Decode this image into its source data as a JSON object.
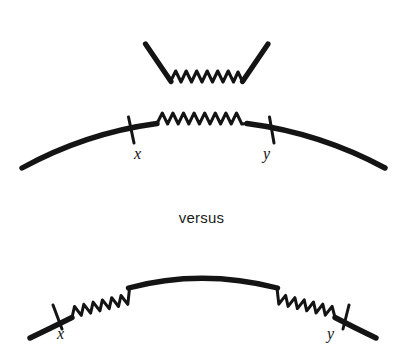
{
  "figure": {
    "type": "line-diagram",
    "background_color": "#ffffff",
    "stroke_color": "#141414",
    "width": 403,
    "height": 362,
    "separator_text": "versus"
  },
  "panels": {
    "top": {
      "name": "kinked-path-with-central-spring",
      "vertex_left": {
        "x": 145,
        "y": 44
      },
      "vertex_right": {
        "x": 268,
        "y": 44
      },
      "spring_start": {
        "x": 170,
        "y": 82
      },
      "spring_end": {
        "x": 243,
        "y": 82
      },
      "spring_peaks": 7,
      "spring_amplitude": 11
    },
    "middle": {
      "name": "arc-with-central-spring",
      "arc_start": {
        "x": 22,
        "y": 168
      },
      "arc_apex": {
        "x": 203,
        "y": 119
      },
      "arc_end": {
        "x": 385,
        "y": 168
      },
      "spring_start": {
        "x": 157,
        "y": 124
      },
      "spring_end": {
        "x": 247,
        "y": 124
      },
      "spring_peaks": 8,
      "spring_amplitude": 10,
      "ticks": [
        {
          "label": "x",
          "x": 131,
          "y": 130
        },
        {
          "label": "y",
          "x": 270,
          "y": 130
        }
      ]
    },
    "bottom": {
      "name": "arc-with-two-end-springs",
      "arc_start": {
        "x": 30,
        "y": 338
      },
      "arc_apex": {
        "x": 201,
        "y": 276
      },
      "arc_end": {
        "x": 376,
        "y": 338
      },
      "left_spring_start": {
        "x": 72,
        "y": 318
      },
      "left_spring_end": {
        "x": 128,
        "y": 288
      },
      "right_spring_start": {
        "x": 277,
        "y": 288
      },
      "right_spring_end": {
        "x": 335,
        "y": 318
      },
      "spring_peaks": 6,
      "spring_amplitude": 10,
      "ticks": [
        {
          "label": "x",
          "x": 57,
          "y": 326
        },
        {
          "label": "y",
          "x": 348,
          "y": 326
        }
      ]
    }
  },
  "labels": {
    "versus": "versus",
    "x_middle": "x",
    "y_middle": "y",
    "x_bottom": "x",
    "y_bottom": "y"
  }
}
